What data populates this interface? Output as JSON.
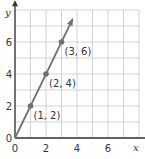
{
  "chart_data": {
    "type": "line",
    "title": "",
    "xlabel": "x",
    "ylabel": "y",
    "xlim": [
      0,
      8
    ],
    "ylim": [
      0,
      8
    ],
    "grid": true,
    "x_ticks": [
      "0",
      "2",
      "4",
      "6"
    ],
    "y_ticks": [
      "0",
      "2",
      "4",
      "6"
    ],
    "series": [
      {
        "name": "y = 2x",
        "x": [
          0,
          1,
          2,
          3,
          3.7
        ],
        "y": [
          0,
          2,
          4,
          6,
          7.4
        ]
      }
    ],
    "points": [
      {
        "x": 1,
        "y": 2,
        "label": "(1, 2)"
      },
      {
        "x": 2,
        "y": 4,
        "label": "(2, 4)"
      },
      {
        "x": 3,
        "y": 6,
        "label": "(3, 6)"
      }
    ],
    "colors": {
      "line": "#707070",
      "grid": "#c8c8c8",
      "axis": "#333333"
    }
  }
}
